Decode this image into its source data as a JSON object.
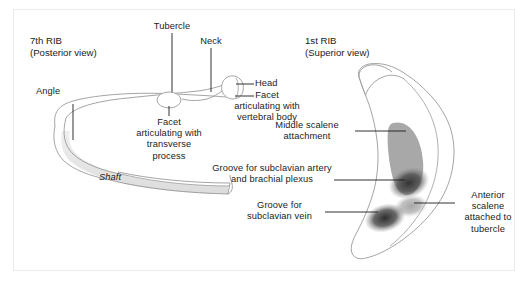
{
  "figure": {
    "kind": "anatomical-diagram",
    "background_color": "#ffffff",
    "outline_color": "#8c8c8c",
    "text_color": "#1b1b1b",
    "frame_color": "#ececec"
  },
  "left_panel": {
    "title": "7th RIB\n(Posterior view)",
    "labels": {
      "angle": "Angle",
      "tubercle": "Tubercle",
      "neck": "Neck",
      "head": "Head",
      "facet_transverse": "Facet\narticulating with\ntransverse\nprocess",
      "facet_vertebral": "Facet\narticulating with\nvertebral body",
      "shaft": "Shaft"
    }
  },
  "right_panel": {
    "title": "1st RIB\n(Superior view)",
    "labels": {
      "middle_scalene": "Middle scalene\nattachment",
      "groove_artery": "Groove for subclavian artery\nand brachial plexus",
      "groove_vein": "Groove for\nsubclavian vein",
      "anterior_scalene": "Anterior\nscalene\nattached to\ntubercle"
    },
    "shading": {
      "middle_scalene_color": "#a8a8a8",
      "anterior_scalene_color": "#a9a9a9",
      "groove_artery_color": "#4e4e4e",
      "groove_vein_color": "#3c3c3c"
    }
  }
}
